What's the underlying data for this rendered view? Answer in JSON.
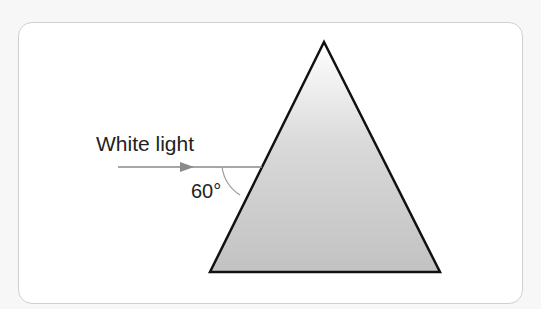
{
  "diagram": {
    "labels": {
      "incident_ray": "White light",
      "angle": "60°"
    },
    "colors": {
      "background": "#f7f7f7",
      "card_bg": "#ffffff",
      "card_border": "#cfcfcf",
      "prism_fill_top": "#ffffff",
      "prism_fill_bottom": "#c6c6c6",
      "prism_stroke": "#111111",
      "ray_color": "#8a8a8a"
    },
    "prism": {
      "apex": [
        324,
        42
      ],
      "bottom_left": [
        210,
        272
      ],
      "bottom_right": [
        440,
        272
      ]
    },
    "ray": {
      "start": [
        118,
        167
      ],
      "end": [
        262,
        167
      ]
    }
  }
}
